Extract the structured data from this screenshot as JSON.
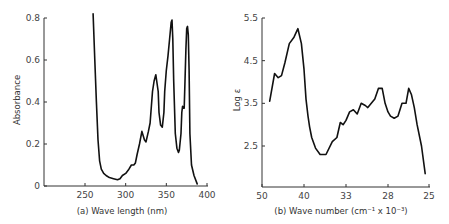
{
  "chart_data": [
    {
      "type": "line",
      "panel": "a",
      "caption": "(a) Wave length (nm)",
      "xlabel": "Wave length (nm)",
      "ylabel": "Absorbance",
      "xlim": [
        200,
        400
      ],
      "ylim": [
        0,
        0.8
      ],
      "x_ticks": [
        250,
        300,
        350,
        400
      ],
      "y_ticks": [
        0,
        0.2,
        0.4,
        0.6,
        0.8
      ],
      "y_tick_labels": [
        "0",
        "0.2",
        "0.4",
        "0.6",
        "0.8"
      ],
      "grid": false,
      "series": [
        {
          "name": "Absorbance",
          "x": [
            260,
            262,
            264,
            266,
            268,
            270,
            273,
            276,
            280,
            285,
            290,
            293,
            296,
            300,
            304,
            307,
            310,
            312,
            314,
            317,
            320,
            323,
            325,
            328,
            330,
            333,
            335,
            337,
            340,
            341,
            343,
            345,
            347,
            348,
            350,
            352,
            354,
            356,
            357,
            358,
            359,
            361,
            363,
            365,
            366,
            368,
            369,
            370,
            371,
            372,
            373,
            374,
            375,
            376,
            377,
            378,
            379,
            381,
            384,
            388
          ],
          "y": [
            0.82,
            0.6,
            0.4,
            0.22,
            0.12,
            0.08,
            0.06,
            0.05,
            0.04,
            0.035,
            0.03,
            0.035,
            0.05,
            0.06,
            0.08,
            0.1,
            0.1,
            0.11,
            0.15,
            0.2,
            0.26,
            0.22,
            0.21,
            0.26,
            0.3,
            0.45,
            0.5,
            0.53,
            0.45,
            0.35,
            0.29,
            0.28,
            0.35,
            0.45,
            0.55,
            0.62,
            0.7,
            0.78,
            0.79,
            0.7,
            0.5,
            0.25,
            0.18,
            0.16,
            0.17,
            0.25,
            0.35,
            0.38,
            0.37,
            0.37,
            0.5,
            0.65,
            0.75,
            0.76,
            0.72,
            0.55,
            0.25,
            0.1,
            0.05,
            0.01
          ]
        }
      ]
    },
    {
      "type": "line",
      "panel": "b",
      "caption": "(b) Wave number (cm⁻¹ x 10⁻³)",
      "xlabel": "Wave number (cm⁻¹ x 10⁻³)",
      "ylabel": "Log ε",
      "x_ticks": [
        50,
        40,
        33,
        28,
        25
      ],
      "y_ticks": [
        2.5,
        3.5,
        4.5,
        5.5
      ],
      "y_tick_labels": [
        "2.5",
        "3.5",
        "4.5",
        "5.5"
      ],
      "ylim": [
        1.7,
        5.5
      ],
      "grid": false,
      "series": [
        {
          "name": "Log ε",
          "x": [
            47.8,
            46.5,
            45.6,
            44.8,
            44.0,
            43.0,
            42.0,
            41.2,
            40.5,
            40.0,
            39.6,
            39.2,
            38.9,
            38.5,
            37.8,
            37.0,
            36.0,
            35.0,
            34.3,
            33.8,
            33.4,
            33.0,
            32.5,
            32.0,
            31.5,
            31.0,
            30.5,
            30.2,
            29.8,
            29.4,
            29.0,
            28.6,
            28.3,
            28.0,
            27.8,
            27.5,
            27.2,
            26.9,
            26.6,
            26.4,
            26.2,
            26.0,
            25.8,
            25.5,
            25.25
          ],
          "y": [
            3.55,
            4.2,
            4.1,
            4.15,
            4.45,
            4.9,
            5.05,
            5.25,
            4.9,
            4.3,
            3.6,
            3.2,
            2.95,
            2.7,
            2.45,
            2.3,
            2.3,
            2.6,
            2.7,
            3.05,
            3.0,
            3.1,
            3.3,
            3.35,
            3.25,
            3.5,
            3.45,
            3.4,
            3.5,
            3.6,
            3.85,
            3.85,
            3.5,
            3.3,
            3.2,
            3.15,
            3.2,
            3.5,
            3.5,
            3.85,
            3.7,
            3.4,
            3.0,
            2.5,
            1.85
          ]
        }
      ]
    }
  ]
}
